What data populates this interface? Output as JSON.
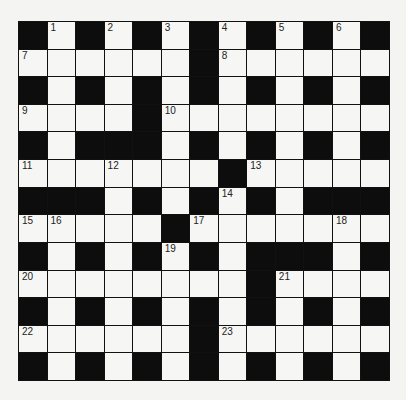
{
  "puzzle": {
    "rows": 13,
    "cols": 13,
    "colors": {
      "black_cell": "#0d0d0d",
      "white_cell": "#f6f6f4",
      "grid_line": "#111111",
      "background": "#f4f4f2"
    },
    "grid": [
      "#.#.#.#.#.#.#",
      "......#......",
      "#.#.#.#.#.#.#",
      "....#........",
      "#.###.#.#.#.#",
      ".......#.....",
      "###.#.#.#.###",
      ".....#.......",
      "#.#.#.#.###.#",
      "........#....",
      "#.#.#.#.#.#.#",
      "......#......",
      "#.#.#.#.#.#.#"
    ],
    "numbers": [
      {
        "row": 0,
        "col": 1,
        "num": "1"
      },
      {
        "row": 0,
        "col": 3,
        "num": "2"
      },
      {
        "row": 0,
        "col": 5,
        "num": "3"
      },
      {
        "row": 0,
        "col": 7,
        "num": "4"
      },
      {
        "row": 0,
        "col": 9,
        "num": "5"
      },
      {
        "row": 0,
        "col": 11,
        "num": "6"
      },
      {
        "row": 1,
        "col": 0,
        "num": "7"
      },
      {
        "row": 1,
        "col": 7,
        "num": "8"
      },
      {
        "row": 3,
        "col": 0,
        "num": "9"
      },
      {
        "row": 3,
        "col": 5,
        "num": "10"
      },
      {
        "row": 5,
        "col": 0,
        "num": "11"
      },
      {
        "row": 5,
        "col": 3,
        "num": "12"
      },
      {
        "row": 5,
        "col": 8,
        "num": "13"
      },
      {
        "row": 6,
        "col": 7,
        "num": "14"
      },
      {
        "row": 7,
        "col": 0,
        "num": "15"
      },
      {
        "row": 7,
        "col": 1,
        "num": "16"
      },
      {
        "row": 7,
        "col": 6,
        "num": "17"
      },
      {
        "row": 7,
        "col": 11,
        "num": "18"
      },
      {
        "row": 8,
        "col": 5,
        "num": "19"
      },
      {
        "row": 9,
        "col": 0,
        "num": "20"
      },
      {
        "row": 9,
        "col": 9,
        "num": "21"
      },
      {
        "row": 11,
        "col": 0,
        "num": "22"
      },
      {
        "row": 11,
        "col": 7,
        "num": "23"
      }
    ]
  }
}
